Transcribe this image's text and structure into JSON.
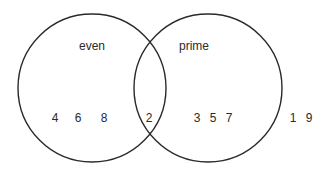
{
  "diagram": {
    "type": "venn",
    "sets": [
      {
        "name": "even",
        "label": "even",
        "only_elements": [
          "4",
          "6",
          "8"
        ]
      },
      {
        "name": "prime",
        "label": "prime",
        "only_elements": [
          "3",
          "5",
          "7"
        ]
      }
    ],
    "intersection": {
      "elements": [
        "2"
      ]
    },
    "outside": {
      "elements": [
        "1",
        "9"
      ]
    },
    "colors": {
      "stroke": "#2a2a2a",
      "text": "#2a2a2a",
      "background": "#ffffff"
    }
  },
  "labels": {
    "even": "even",
    "prime": "prime"
  },
  "numbers": {
    "n4": "4",
    "n6": "6",
    "n8": "8",
    "n2": "2",
    "n3": "3",
    "n5": "5",
    "n7": "7",
    "n1": "1",
    "n9": "9"
  }
}
